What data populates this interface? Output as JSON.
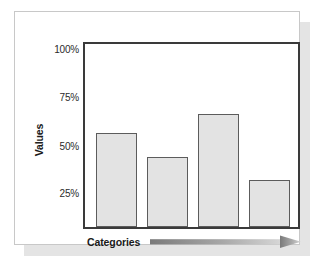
{
  "chart_data": {
    "type": "bar",
    "title": "",
    "subtitle": "",
    "xlabel": "Categories",
    "ylabel": "Values",
    "categories": [
      "",
      "",
      "",
      ""
    ],
    "values": [
      64,
      51,
      74,
      38
    ],
    "value_suffix": "%",
    "ytick_labels": [
      "100%",
      "75%",
      "50%",
      "25%"
    ],
    "ytick_values": [
      100,
      75,
      50,
      25
    ],
    "ylim": [
      12.5,
      112.5
    ],
    "grid": false,
    "legend": null,
    "legend_position": "none",
    "annotations": [
      {
        "name": "x-axis-arrow",
        "description": "gradient arrow pointing right beside Categories label"
      }
    ]
  },
  "axes": {
    "y": {
      "title": "Values",
      "ticks": [
        {
          "label": "100%",
          "value": 100
        },
        {
          "label": "75%",
          "value": 75
        },
        {
          "label": "50%",
          "value": 50
        },
        {
          "label": "25%",
          "value": 25
        }
      ]
    },
    "x": {
      "title": "Categories"
    }
  },
  "colors": {
    "bar_fill": "#e3e3e3",
    "bar_stroke": "#5c5c5c",
    "frame_stroke": "#3a3a3a",
    "card_background": "#ffffff",
    "card_border": "#c8c8c8",
    "card_shadow": "#e4e4e4",
    "page_background": "#ffffff",
    "text": "#1a1a1a",
    "tick_text": "#2b2b2b",
    "arrow_dark": "#7a7a7a",
    "arrow_light": "#d8d8d8"
  }
}
